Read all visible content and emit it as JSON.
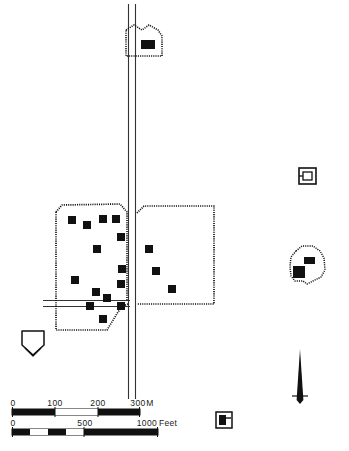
{
  "map": {
    "title": "Archaeological site plan",
    "background_color": "#ffffff",
    "ink_color": "#111111",
    "width": 349,
    "height": 451
  },
  "scale_bars": [
    {
      "name": "metric",
      "unit_label": "M",
      "ticks": [
        "0",
        "100",
        "200",
        "300"
      ],
      "max_value": 300,
      "bar_x": 12,
      "bar_y": 409,
      "bar_width": 128,
      "bar_height": 6,
      "segments": 3
    },
    {
      "name": "imperial",
      "unit_label": "Feet",
      "ticks": [
        "0",
        "500",
        "1000"
      ],
      "max_value": 1000,
      "bar_x": 12,
      "bar_y": 429,
      "bar_width": 146,
      "bar_height": 6,
      "segments": 4
    }
  ],
  "north_arrow": {
    "label": "",
    "x": 300,
    "tip_y": 349,
    "base_y": 404,
    "crossbar_y": 396,
    "crossbar_half_width": 8
  },
  "features": {
    "road": {
      "name": "main-road",
      "orientation": "north-south",
      "left_edge_x": 128,
      "right_edge_x": 136,
      "top_y": 4,
      "bottom_y": 399
    },
    "side_road": {
      "name": "side-road-west",
      "orientation": "east-west",
      "top_y": 300,
      "bottom_y": 306,
      "left_x": 43,
      "right_x": 128
    },
    "enclosure_west": {
      "name": "west-enclosure",
      "style": "dotted-boundary"
    },
    "enclosure_east": {
      "name": "east-enclosure",
      "style": "dotted-boundary"
    },
    "enclosure_south_west": {
      "name": "southwest-annex",
      "style": "dotted-boundary"
    },
    "enclosure_north": {
      "name": "north-enclosure",
      "style": "dotted-boundary"
    },
    "mound_east_upper": {
      "name": "east-mound-upper",
      "style": "nested-rectangles"
    },
    "mound_east_lower": {
      "name": "east-mound-lower",
      "style": "dotted-boundary"
    },
    "pentagon_southwest": {
      "name": "southwest-pentagon",
      "style": "double-outline"
    },
    "legend_symbol": {
      "name": "legend-structure-symbol",
      "x": 215,
      "y": 412
    }
  },
  "structures": {
    "label": "Structure (filled rectangle)",
    "fill": "#111111",
    "west_enclosure_structures": [
      {
        "x": 68,
        "y": 216,
        "w": 8,
        "h": 8
      },
      {
        "x": 83,
        "y": 221,
        "w": 8,
        "h": 8
      },
      {
        "x": 99,
        "y": 215,
        "w": 8,
        "h": 8
      },
      {
        "x": 112,
        "y": 215,
        "w": 8,
        "h": 8
      },
      {
        "x": 117,
        "y": 233,
        "w": 8,
        "h": 8
      },
      {
        "x": 93,
        "y": 245,
        "w": 8,
        "h": 8
      },
      {
        "x": 118,
        "y": 265,
        "w": 8,
        "h": 8
      },
      {
        "x": 71,
        "y": 276,
        "w": 8,
        "h": 8
      },
      {
        "x": 117,
        "y": 280,
        "w": 8,
        "h": 8
      },
      {
        "x": 92,
        "y": 288,
        "w": 8,
        "h": 8
      },
      {
        "x": 103,
        "y": 294,
        "w": 8,
        "h": 8
      },
      {
        "x": 86,
        "y": 302,
        "w": 8,
        "h": 8
      },
      {
        "x": 117,
        "y": 302,
        "w": 8,
        "h": 8
      },
      {
        "x": 99,
        "y": 315,
        "w": 8,
        "h": 8
      }
    ],
    "east_enclosure_structures": [
      {
        "x": 145,
        "y": 245,
        "w": 8,
        "h": 8
      },
      {
        "x": 152,
        "y": 267,
        "w": 8,
        "h": 8
      },
      {
        "x": 168,
        "y": 285,
        "w": 8,
        "h": 8
      }
    ],
    "north_enclosure_structures": [
      {
        "x": 142,
        "y": 40,
        "w": 13,
        "h": 8
      }
    ],
    "east_mound_structures": [
      {
        "x": 304,
        "y": 258,
        "w": 10,
        "h": 7
      },
      {
        "x": 294,
        "y": 267,
        "w": 11,
        "h": 11
      }
    ]
  }
}
